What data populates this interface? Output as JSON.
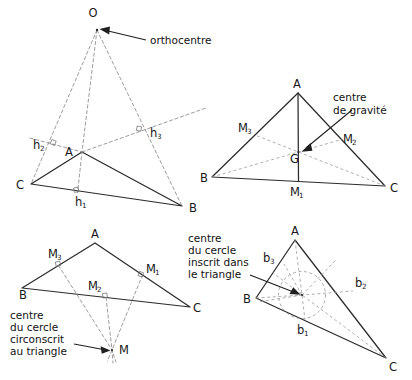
{
  "figure": {
    "title_visible": false,
    "background": "#ffffff",
    "stroke_solid": "#2b2b2b",
    "stroke_dashed": "#8a8a8a",
    "panels": [
      {
        "id": "orthocentre",
        "annotation": "orthocentre",
        "center_label": "O",
        "vertices": [
          {
            "label": "A",
            "x": 82,
            "y": 152
          },
          {
            "label": "B",
            "x": 182,
            "y": 206
          },
          {
            "label": "C",
            "x": 31,
            "y": 184
          }
        ],
        "foot_labels": [
          {
            "label": "h",
            "sub": "1"
          },
          {
            "label": "h",
            "sub": "2"
          },
          {
            "label": "h",
            "sub": "3"
          }
        ]
      },
      {
        "id": "centre-de-gravite",
        "annotation": "centre\nde gravité",
        "annotation_line1": "centre",
        "annotation_line2": "de gravité",
        "center_label": "G",
        "vertices": [
          {
            "label": "A",
            "x": 298,
            "y": 93
          },
          {
            "label": "B",
            "x": 212,
            "y": 177
          },
          {
            "label": "C",
            "x": 385,
            "y": 186
          }
        ],
        "midpoint_labels": [
          {
            "label": "M",
            "sub": "1"
          },
          {
            "label": "M",
            "sub": "2"
          },
          {
            "label": "M",
            "sub": "3"
          }
        ]
      },
      {
        "id": "centre-cercle-circonscrit",
        "annotation_line1": "centre",
        "annotation_line2": "du cercle",
        "annotation_line3": "circonscrit",
        "annotation_line4": "au triangle",
        "center_label": "M",
        "vertices": [
          {
            "label": "A",
            "x": 95,
            "y": 243
          },
          {
            "label": "B",
            "x": 22,
            "y": 288
          },
          {
            "label": "C",
            "x": 190,
            "y": 307
          }
        ],
        "midpoint_labels": [
          {
            "label": "M",
            "sub": "1"
          },
          {
            "label": "M",
            "sub": "2"
          },
          {
            "label": "M",
            "sub": "3"
          }
        ]
      },
      {
        "id": "centre-cercle-inscrit",
        "annotation_line1": "centre",
        "annotation_line2": "du cercle",
        "annotation_line3": "inscrit dans",
        "annotation_line4": "le triangle",
        "vertices": [
          {
            "label": "A",
            "x": 295,
            "y": 240
          },
          {
            "label": "B",
            "x": 256,
            "y": 298
          },
          {
            "label": "C",
            "x": 386,
            "y": 358
          }
        ],
        "bisector_labels": [
          {
            "label": "b",
            "sub": "1"
          },
          {
            "label": "b",
            "sub": "2"
          },
          {
            "label": "b",
            "sub": "3"
          }
        ]
      }
    ]
  }
}
